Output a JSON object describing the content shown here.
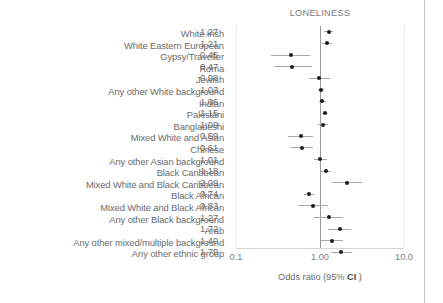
{
  "figure": {
    "title": "LONELINESS",
    "x_axis_title_prefix": "Odds ratio (95% ",
    "x_axis_title_ci": "CI",
    "x_axis_title_suffix": " )",
    "tick_labels": [
      "0.1",
      "1.00",
      "10.0"
    ]
  },
  "chart_data": {
    "type": "scatter",
    "subtype": "forest-plot",
    "title": "LONELINESS",
    "xlabel": "Odds ratio (95% CI )",
    "ylabel": "",
    "xscale": "log",
    "xlim": [
      0.1,
      10.0
    ],
    "xticks": [
      0.1,
      1.0,
      10.0
    ],
    "xtick_labels": [
      "0.1",
      "1.00",
      "10.0"
    ],
    "reference_line": 1.0,
    "grid": "dotted vertical gridlines at 0.1 and 10.0",
    "legend": null,
    "categories": [
      "White Irish",
      "White Eastern European",
      "Gypsy/Traveller",
      "Roma",
      "Jewish",
      "Any other White background",
      "Indian",
      "Pakistani",
      "Bangladeshi",
      "Mixed White and Asian",
      "Chinese",
      "Any other Asian background",
      "Black Caribbean",
      "Mixed White and Black Caribbean",
      "Black African",
      "Mixed White and Black African",
      "Any other Black background",
      "Arab",
      "Any other mixed/multiple background",
      "Any other ethnic group"
    ],
    "values": [
      1.27,
      1.21,
      0.45,
      0.47,
      0.98,
      1.03,
      1.06,
      1.15,
      1.09,
      0.59,
      0.61,
      1.01,
      1.18,
      2.09,
      0.74,
      0.83,
      1.27,
      1.72,
      1.4,
      1.79
    ],
    "ci_low": [
      1.13,
      1.05,
      0.26,
      0.28,
      0.73,
      0.95,
      0.96,
      1.05,
      0.95,
      0.42,
      0.45,
      0.84,
      1.02,
      1.38,
      0.65,
      0.55,
      0.86,
      1.25,
      1.04,
      1.34
    ],
    "ci_high": [
      1.43,
      1.4,
      0.77,
      0.8,
      1.32,
      1.12,
      1.17,
      1.26,
      1.25,
      0.83,
      0.83,
      1.21,
      1.37,
      3.16,
      0.84,
      1.26,
      1.88,
      2.37,
      1.88,
      2.39
    ],
    "rows": [
      {
        "label": "White Irish",
        "value": "1.27",
        "or": 1.27,
        "lo": 1.13,
        "hi": 1.43
      },
      {
        "label": "White Eastern European",
        "value": "1.21",
        "or": 1.21,
        "lo": 1.05,
        "hi": 1.4
      },
      {
        "label": "Gypsy/Traveller",
        "value": "0.45",
        "or": 0.45,
        "lo": 0.26,
        "hi": 0.77
      },
      {
        "label": "Roma",
        "value": "0.47",
        "or": 0.47,
        "lo": 0.28,
        "hi": 0.8
      },
      {
        "label": "Jewish",
        "value": "0.98",
        "or": 0.98,
        "lo": 0.73,
        "hi": 1.32
      },
      {
        "label": "Any other White background",
        "value": "1.03",
        "or": 1.03,
        "lo": 0.95,
        "hi": 1.12
      },
      {
        "label": "Indian",
        "value": "1.06",
        "or": 1.06,
        "lo": 0.96,
        "hi": 1.17
      },
      {
        "label": "Pakistani",
        "value": "1.15",
        "or": 1.15,
        "lo": 1.05,
        "hi": 1.26
      },
      {
        "label": "Bangladeshi",
        "value": "1.09",
        "or": 1.09,
        "lo": 0.95,
        "hi": 1.25
      },
      {
        "label": "Mixed White and Asian",
        "value": "0.59",
        "or": 0.59,
        "lo": 0.42,
        "hi": 0.83
      },
      {
        "label": "Chinese",
        "value": "0.61",
        "or": 0.61,
        "lo": 0.45,
        "hi": 0.83
      },
      {
        "label": "Any other Asian background",
        "value": "1.01",
        "or": 1.01,
        "lo": 0.84,
        "hi": 1.21
      },
      {
        "label": "Black Caribbean",
        "value": "1.18",
        "or": 1.18,
        "lo": 1.02,
        "hi": 1.37
      },
      {
        "label": "Mixed White and Black Caribbean",
        "value": "2.09",
        "or": 2.09,
        "lo": 1.38,
        "hi": 3.16
      },
      {
        "label": "Black African",
        "value": "0.74",
        "or": 0.74,
        "lo": 0.65,
        "hi": 0.84
      },
      {
        "label": "Mixed White and Black African",
        "value": "0.83",
        "or": 0.83,
        "lo": 0.55,
        "hi": 1.26
      },
      {
        "label": "Any other Black background",
        "value": "1.27",
        "or": 1.27,
        "lo": 0.86,
        "hi": 1.88
      },
      {
        "label": "Arab",
        "value": "1.72",
        "or": 1.72,
        "lo": 1.25,
        "hi": 2.37
      },
      {
        "label": "Any other mixed/multiple background",
        "value": "1.40",
        "or": 1.4,
        "lo": 1.04,
        "hi": 1.88
      },
      {
        "label": "Any other ethnic group",
        "value": "1.79",
        "or": 1.79,
        "lo": 1.34,
        "hi": 2.39
      }
    ]
  }
}
